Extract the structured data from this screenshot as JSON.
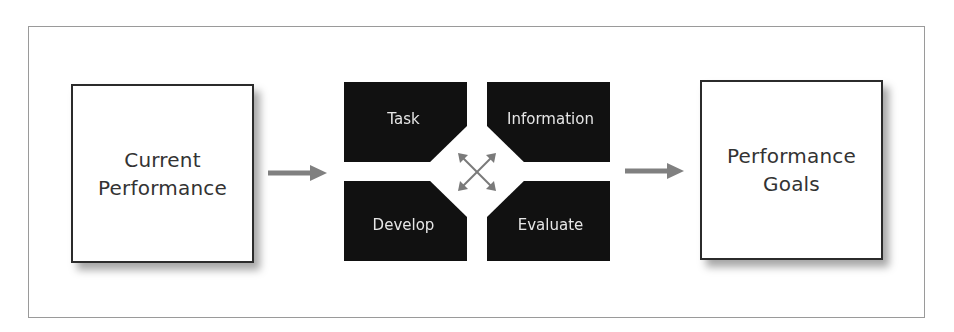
{
  "diagram": {
    "left_box": {
      "label": "Current\nPerformance"
    },
    "right_box": {
      "label": "Performance\nGoals"
    },
    "blocks": [
      {
        "id": "task",
        "label": "Task"
      },
      {
        "id": "information",
        "label": "Information"
      },
      {
        "id": "develop",
        "label": "Develop"
      },
      {
        "id": "evaluate",
        "label": "Evaluate"
      }
    ],
    "connectors": {
      "left_arrow": "arrow-right",
      "right_arrow": "arrow-right",
      "center": "crossed-double-arrows"
    },
    "colors": {
      "frame_border": "#9a9a9a",
      "box_border": "#2b2b2b",
      "block_fill": "#111111",
      "block_text": "#e6e6e6",
      "arrow": "#808080"
    }
  }
}
